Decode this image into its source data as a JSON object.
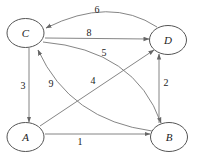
{
  "diagram": {
    "type": "weighted-directed-graph",
    "nodes": [
      {
        "id": "C",
        "label": "C"
      },
      {
        "id": "D",
        "label": "D"
      },
      {
        "id": "A",
        "label": "A"
      },
      {
        "id": "B",
        "label": "B"
      }
    ],
    "edges": [
      {
        "from": "D",
        "to": "C",
        "weight": "6"
      },
      {
        "from": "C",
        "to": "D",
        "weight": "8"
      },
      {
        "from": "C",
        "to": "B",
        "weight": "5"
      },
      {
        "from": "A",
        "to": "D",
        "weight": "4"
      },
      {
        "from": "B",
        "to": "C",
        "weight": "9"
      },
      {
        "from": "C",
        "to": "A",
        "weight": "3"
      },
      {
        "from": "B",
        "to": "D",
        "weight": "2"
      },
      {
        "from": "A",
        "to": "B",
        "weight": "1"
      }
    ]
  }
}
